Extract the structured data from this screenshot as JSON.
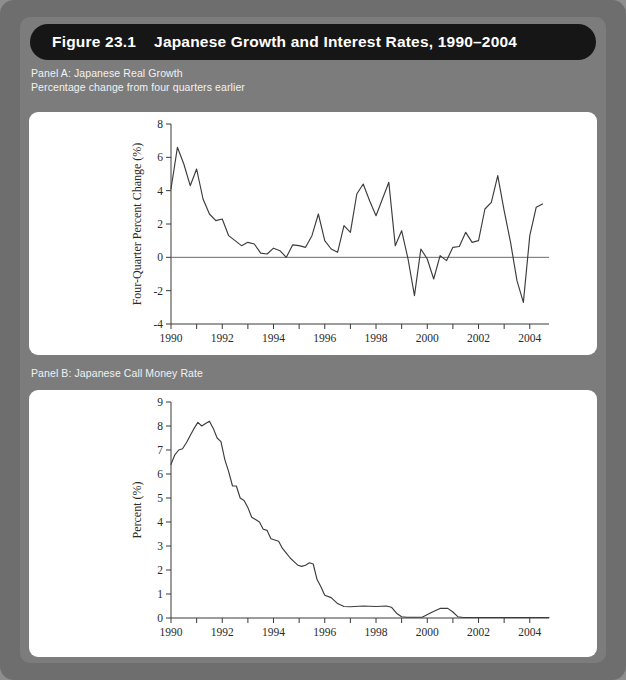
{
  "figure": {
    "title": "Figure 23.1    Japanese Growth and Interest Rates, 1990–2004",
    "panelA_label": "Panel A: Japanese Real Growth\nPercentage change from four quarters earlier",
    "panelB_label": "Panel B: Japanese Call Money Rate"
  },
  "colors": {
    "outer_frame": "#6e6e6e",
    "inner_frame": "#7c7c7c",
    "title_bar": "#161616",
    "title_text": "#ffffff",
    "label_text": "#f2f2f2",
    "card": "#ffffff",
    "line": "#3c3c3c",
    "axis": "#3a3a3a"
  },
  "chart_data": [
    {
      "type": "line",
      "id": "panel-a",
      "title": "Panel A: Japanese Real Growth",
      "subtitle": "Percentage change from four quarters earlier",
      "xlabel": "",
      "ylabel": "Four-Quarter Percent Change (%)",
      "xlim": [
        1990,
        2004.75
      ],
      "ylim": [
        -4,
        8
      ],
      "yticks": [
        -4,
        -2,
        0,
        2,
        4,
        6,
        8
      ],
      "ytick_labels": [
        "-4",
        "-2",
        "0",
        "2",
        "4",
        "6",
        "8"
      ],
      "xticks": [
        1990,
        1991,
        1992,
        1993,
        1994,
        1995,
        1996,
        1997,
        1998,
        1999,
        2000,
        2001,
        2002,
        2003,
        2004
      ],
      "xtick_labels": [
        "1990",
        "",
        "1992",
        "",
        "1994",
        "",
        "1996",
        "",
        "1998",
        "",
        "2000",
        "",
        "2002",
        "",
        "2004"
      ],
      "grid": false,
      "zero_line": true,
      "legend": null,
      "x": [
        1990.0,
        1990.25,
        1990.5,
        1990.75,
        1991.0,
        1991.25,
        1991.5,
        1991.75,
        1992.0,
        1992.25,
        1992.5,
        1992.75,
        1993.0,
        1993.25,
        1993.5,
        1993.75,
        1994.0,
        1994.25,
        1994.5,
        1994.75,
        1995.0,
        1995.25,
        1995.5,
        1995.75,
        1996.0,
        1996.25,
        1996.5,
        1996.75,
        1997.0,
        1997.25,
        1997.5,
        1997.75,
        1998.0,
        1998.25,
        1998.5,
        1998.75,
        1999.0,
        1999.25,
        1999.5,
        1999.75,
        2000.0,
        2000.25,
        2000.5,
        2000.75,
        2001.0,
        2001.25,
        2001.5,
        2001.75,
        2002.0,
        2002.25,
        2002.5,
        2002.75,
        2003.0,
        2003.25,
        2003.5,
        2003.75,
        2004.0,
        2004.25,
        2004.5
      ],
      "y": [
        4.1,
        6.6,
        5.6,
        4.3,
        5.3,
        3.5,
        2.6,
        2.2,
        2.3,
        1.3,
        1.0,
        0.7,
        0.9,
        0.8,
        0.25,
        0.2,
        0.55,
        0.4,
        0.0,
        0.75,
        0.7,
        0.6,
        1.3,
        2.6,
        1.0,
        0.5,
        0.3,
        1.9,
        1.5,
        3.8,
        4.4,
        3.4,
        2.5,
        3.5,
        4.5,
        0.7,
        1.6,
        -0.1,
        -2.3,
        0.5,
        -0.1,
        -1.3,
        0.1,
        -0.2,
        0.6,
        0.65,
        1.5,
        0.9,
        1.0,
        2.9,
        3.3,
        4.9,
        2.8,
        0.9,
        -1.4,
        -2.7,
        1.3,
        3.0,
        3.2
      ],
      "series_note": "Four-quarter percent change in Japanese real GDP, quarterly 1990Q1-2004Q3"
    },
    {
      "type": "line",
      "id": "panel-b",
      "title": "Panel B: Japanese Call Money Rate",
      "subtitle": "",
      "xlabel": "",
      "ylabel": "Percent (%)",
      "xlim": [
        1990,
        2004.75
      ],
      "ylim": [
        0,
        9
      ],
      "yticks": [
        0,
        1,
        2,
        3,
        4,
        5,
        6,
        7,
        8,
        9
      ],
      "ytick_labels": [
        "0",
        "1",
        "2",
        "3",
        "4",
        "5",
        "6",
        "7",
        "8",
        "9"
      ],
      "xticks": [
        1990,
        1991,
        1992,
        1993,
        1994,
        1995,
        1996,
        1997,
        1998,
        1999,
        2000,
        2001,
        2002,
        2003,
        2004
      ],
      "xtick_labels": [
        "1990",
        "",
        "1992",
        "",
        "1994",
        "",
        "1996",
        "",
        "1998",
        "",
        "2000",
        "",
        "2002",
        "",
        "2004"
      ],
      "grid": false,
      "zero_line": false,
      "legend": null,
      "x": [
        1990.0,
        1990.15,
        1990.3,
        1990.45,
        1990.6,
        1990.75,
        1990.9,
        1991.05,
        1991.2,
        1991.35,
        1991.5,
        1991.65,
        1991.8,
        1991.95,
        1992.1,
        1992.25,
        1992.4,
        1992.55,
        1992.7,
        1992.85,
        1993.0,
        1993.15,
        1993.3,
        1993.45,
        1993.6,
        1993.75,
        1993.9,
        1994.05,
        1994.2,
        1994.35,
        1994.5,
        1994.65,
        1994.8,
        1994.95,
        1995.1,
        1995.25,
        1995.4,
        1995.55,
        1995.7,
        1995.85,
        1996.0,
        1996.25,
        1996.5,
        1996.75,
        1997.0,
        1997.5,
        1998.0,
        1998.4,
        1998.6,
        1998.8,
        1999.0,
        1999.2,
        1999.4,
        1999.8,
        2000.2,
        2000.5,
        2000.8,
        2001.0,
        2001.2,
        2001.4,
        2001.6,
        2002.0,
        2002.5,
        2003.0,
        2003.5,
        2004.0,
        2004.5,
        2004.75
      ],
      "y": [
        6.4,
        6.8,
        7.0,
        7.05,
        7.3,
        7.6,
        7.9,
        8.15,
        8.0,
        8.1,
        8.2,
        7.9,
        7.5,
        7.35,
        6.6,
        6.1,
        5.5,
        5.5,
        5.0,
        4.9,
        4.6,
        4.2,
        4.1,
        4.0,
        3.7,
        3.65,
        3.3,
        3.25,
        3.2,
        2.9,
        2.7,
        2.5,
        2.35,
        2.2,
        2.15,
        2.2,
        2.3,
        2.25,
        1.6,
        1.3,
        0.95,
        0.85,
        0.6,
        0.48,
        0.47,
        0.5,
        0.48,
        0.5,
        0.45,
        0.2,
        0.05,
        0.03,
        0.03,
        0.03,
        0.25,
        0.4,
        0.4,
        0.25,
        0.05,
        0.02,
        0.02,
        0.02,
        0.02,
        0.02,
        0.02,
        0.02,
        0.02,
        0.02
      ],
      "series_note": "Japanese overnight call money rate, 1990-2004"
    }
  ]
}
